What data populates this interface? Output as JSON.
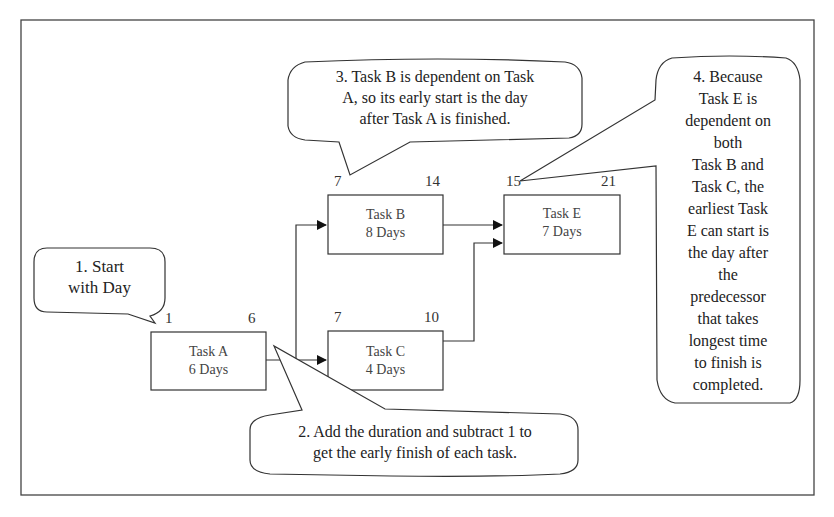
{
  "diagram": {
    "type": "network-diagram-forward-pass",
    "tasks": [
      {
        "id": "A",
        "name": "Task A",
        "duration": "6 Days",
        "early_start": "1",
        "early_finish": "6"
      },
      {
        "id": "B",
        "name": "Task B",
        "duration": "8 Days",
        "early_start": "7",
        "early_finish": "14"
      },
      {
        "id": "C",
        "name": "Task C",
        "duration": "4 Days",
        "early_start": "7",
        "early_finish": "10"
      },
      {
        "id": "E",
        "name": "Task E",
        "duration": "7 Days",
        "early_start": "15",
        "early_finish": "21"
      }
    ],
    "edges": [
      {
        "from": "A",
        "to": "B"
      },
      {
        "from": "A",
        "to": "C"
      },
      {
        "from": "B",
        "to": "E"
      },
      {
        "from": "C",
        "to": "E"
      }
    ],
    "callouts": [
      {
        "id": "1",
        "lines": [
          "1. Start",
          "with Day"
        ]
      },
      {
        "id": "2",
        "lines": [
          "2. Add the duration and subtract 1 to",
          "get the early finish of each task."
        ]
      },
      {
        "id": "3",
        "lines": [
          "3. Task B is dependent on Task",
          "A, so its early start is the day",
          "after Task A is finished."
        ]
      },
      {
        "id": "4",
        "lines": [
          "4. Because",
          "Task E is",
          "dependent on",
          "both",
          "Task B and",
          "Task C, the",
          "earliest Task",
          "E can start is",
          "the day after",
          "the",
          "predecessor",
          "that takes",
          "longest time",
          "to finish is",
          "completed."
        ]
      }
    ],
    "colors": {
      "line": "#333333",
      "background": "#ffffff",
      "text": "#2a2a2a"
    }
  }
}
